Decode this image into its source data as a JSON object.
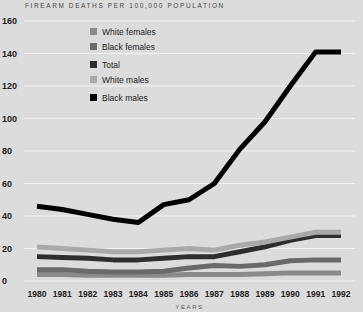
{
  "chart_data": {
    "type": "line",
    "title": "FIREARM DEATHS PER 100,000 POPULATION",
    "xlabel": "YEARS",
    "ylabel": "",
    "ylim": [
      0,
      160
    ],
    "yticks": [
      0,
      20,
      40,
      60,
      80,
      100,
      120,
      140,
      160
    ],
    "grid": true,
    "legend_position": "upper-left",
    "x": [
      "1980",
      "1981",
      "1982",
      "1983",
      "1984",
      "1985",
      "1986",
      "1987",
      "1988",
      "1989",
      "1990",
      "1991",
      "1992"
    ],
    "series": [
      {
        "name": "White females",
        "color": "#8a8a8a",
        "values": [
          4,
          4,
          3.5,
          3.5,
          3.5,
          3.5,
          4,
          4,
          4,
          4.5,
          5,
          5,
          5
        ]
      },
      {
        "name": "Black females",
        "color": "#6a6a6a",
        "values": [
          7,
          7,
          6,
          5.5,
          5.5,
          6,
          8,
          9.5,
          9,
          10,
          12.5,
          13,
          13
        ]
      },
      {
        "name": "Total",
        "color": "#2e2e2e",
        "values": [
          15,
          14.5,
          14,
          13,
          13,
          14,
          15,
          15,
          18,
          21,
          25,
          28,
          28
        ]
      },
      {
        "name": "White males",
        "color": "#a9a9a9",
        "values": [
          21,
          20,
          19,
          18,
          18,
          19,
          20,
          19,
          22,
          24,
          27,
          30,
          30
        ]
      },
      {
        "name": "Black males",
        "color": "#000000",
        "values": [
          46,
          44,
          41,
          38,
          36,
          47,
          50,
          60,
          81,
          98,
          120,
          141,
          141
        ]
      }
    ]
  }
}
